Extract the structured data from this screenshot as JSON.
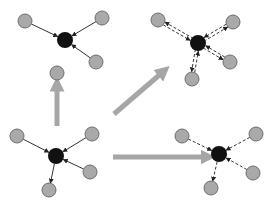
{
  "colors": {
    "background": "#ffffff",
    "node_fill": "#a9a9a9",
    "node_stroke": "#6e6e6e",
    "center_fill": "#111111",
    "edge": "#333333",
    "transition_arrow": "#a6a6a6"
  },
  "node_radius": 7,
  "center_radius": 8,
  "panels": [
    {
      "name": "top-left",
      "center": [
        65,
        40
      ],
      "edge_style": "solid",
      "nodes": [
        {
          "pos": [
            25,
            21
          ],
          "direction": "in"
        },
        {
          "pos": [
            102,
            18
          ],
          "direction": "in"
        },
        {
          "pos": [
            96,
            62
          ],
          "direction": "in"
        }
      ]
    },
    {
      "name": "top-right",
      "center": [
        198,
        43
      ],
      "edge_style": "double-dashed",
      "nodes": [
        {
          "pos": [
            158,
            20
          ],
          "direction": "both"
        },
        {
          "pos": [
            233,
            22
          ],
          "direction": "both"
        },
        {
          "pos": [
            230,
            62
          ],
          "direction": "both"
        },
        {
          "pos": [
            192,
            79
          ],
          "direction": "both"
        }
      ]
    },
    {
      "name": "bottom-left",
      "center": [
        56,
        156
      ],
      "edge_style": "solid",
      "nodes": [
        {
          "pos": [
            17,
            136
          ],
          "direction": "in"
        },
        {
          "pos": [
            92,
            134
          ],
          "direction": "in"
        },
        {
          "pos": [
            90,
            172
          ],
          "direction": "in"
        },
        {
          "pos": [
            49,
            190
          ],
          "direction": "out"
        }
      ]
    },
    {
      "name": "bottom-right",
      "center": [
        219,
        154
      ],
      "edge_style": "dashed",
      "nodes": [
        {
          "pos": [
            182,
            136
          ],
          "direction": "in"
        },
        {
          "pos": [
            256,
            134
          ],
          "direction": "in"
        },
        {
          "pos": [
            253,
            173
          ],
          "direction": "in"
        },
        {
          "pos": [
            211,
            188
          ],
          "direction": "out"
        }
      ]
    }
  ],
  "isolated_nodes": [
    {
      "pos": [
        57,
        73
      ]
    }
  ],
  "transition_arrows": [
    {
      "name": "up",
      "from": [
        57,
        126
      ],
      "to": [
        57,
        84
      ]
    },
    {
      "name": "diagonal",
      "from": [
        114,
        114
      ],
      "to": [
        164,
        71
      ]
    },
    {
      "name": "right",
      "from": [
        113,
        157
      ],
      "to": [
        208,
        157
      ]
    }
  ]
}
